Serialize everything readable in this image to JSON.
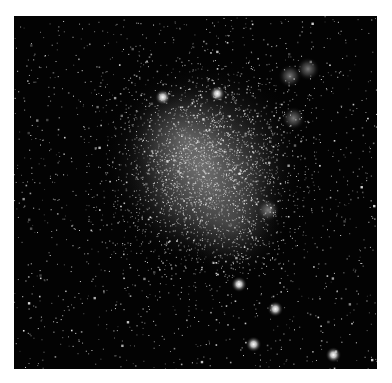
{
  "image": {
    "subject": "irregular dwarf galaxy star field",
    "background_color": "#030303",
    "frame_color": "#ffffff",
    "galaxy": {
      "color": "#d9d9d9",
      "center": [
        0.55,
        0.42
      ],
      "brightness": 0.75
    },
    "companion_blobs": [
      {
        "name": "upper-right-nebula-1",
        "at": [
          0.76,
          0.17
        ]
      },
      {
        "name": "upper-right-nebula-2",
        "at": [
          0.81,
          0.15
        ]
      },
      {
        "name": "right-nebula",
        "at": [
          0.77,
          0.29
        ]
      },
      {
        "name": "lower-right-nebula",
        "at": [
          0.7,
          0.55
        ]
      }
    ],
    "bright_stars": [
      {
        "at": [
          0.62,
          0.76
        ]
      },
      {
        "at": [
          0.72,
          0.83
        ]
      },
      {
        "at": [
          0.66,
          0.93
        ]
      },
      {
        "at": [
          0.88,
          0.96
        ]
      },
      {
        "at": [
          0.41,
          0.23
        ]
      },
      {
        "at": [
          0.56,
          0.22
        ]
      }
    ],
    "field_star_count": 1400,
    "galaxy_star_count": 2600
  }
}
